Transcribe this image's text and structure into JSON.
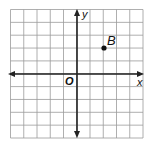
{
  "diagram": {
    "type": "coordinate-plane",
    "grid": {
      "cols": 10,
      "rows": 10,
      "x_range": [
        -5,
        5
      ],
      "y_range": [
        -5,
        5
      ],
      "line_color": "#9a9a9a",
      "axis_color": "#222222"
    },
    "axes": {
      "x_label": "x",
      "y_label": "y",
      "origin_label": "O"
    },
    "points": [
      {
        "label": "B",
        "x": 2,
        "y": 2,
        "color": "#111111"
      }
    ]
  }
}
